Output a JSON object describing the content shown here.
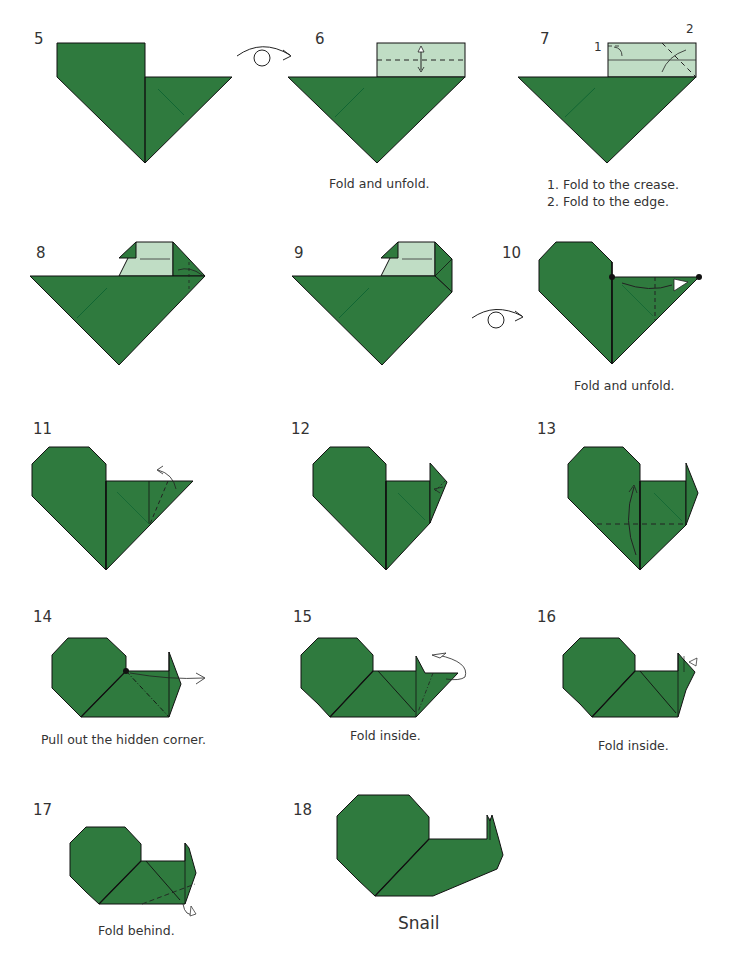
{
  "colors": {
    "paper_green": "#2f7a3e",
    "paper_light": "#c0ddc5",
    "line": "#111111",
    "text": "#333333"
  },
  "steps": [
    {
      "number": "5",
      "caption": ""
    },
    {
      "number": "6",
      "caption": "Fold and unfold."
    },
    {
      "number": "7",
      "caption_lines": [
        "1. Fold to the crease.",
        "2. Fold to the edge."
      ],
      "labels": [
        "1",
        "2"
      ]
    },
    {
      "number": "8",
      "caption": ""
    },
    {
      "number": "9",
      "caption": ""
    },
    {
      "number": "10",
      "caption": "Fold and unfold."
    },
    {
      "number": "11",
      "caption": ""
    },
    {
      "number": "12",
      "caption": ""
    },
    {
      "number": "13",
      "caption": ""
    },
    {
      "number": "14",
      "caption": "Pull out the hidden corner."
    },
    {
      "number": "15",
      "caption": "Fold inside."
    },
    {
      "number": "16",
      "caption": "Fold inside."
    },
    {
      "number": "17",
      "caption": "Fold behind."
    },
    {
      "number": "18",
      "caption": "Snail"
    }
  ],
  "symbols": [
    "turn-over-icon",
    "turn-over-icon"
  ]
}
